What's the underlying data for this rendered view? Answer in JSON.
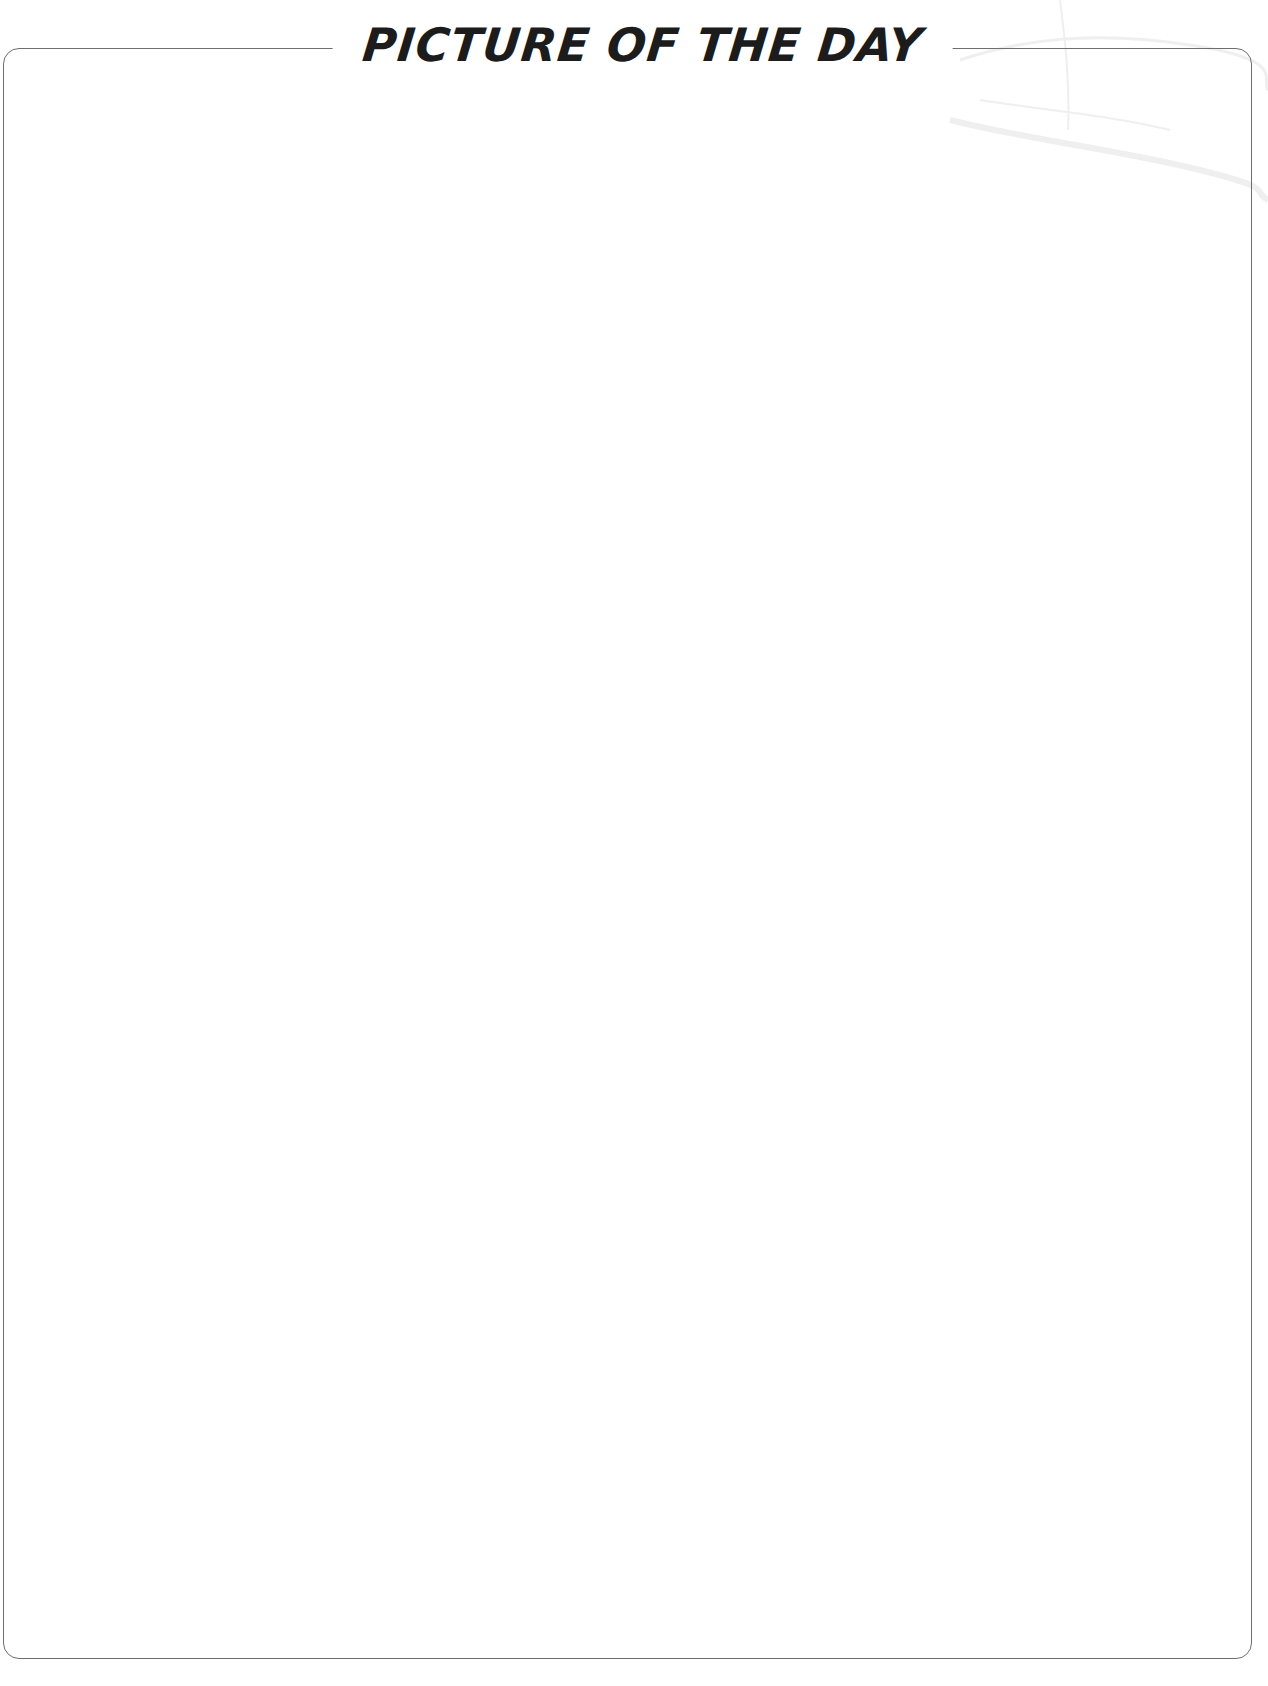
{
  "page": {
    "title": "PICTURE OF THE DAY",
    "bottom_caption": "",
    "bottom_caption_note": "clipped"
  },
  "frame": {
    "border_color": "#6e6e6e",
    "background": "#ffffff"
  },
  "drawing_area": {
    "content": ""
  }
}
